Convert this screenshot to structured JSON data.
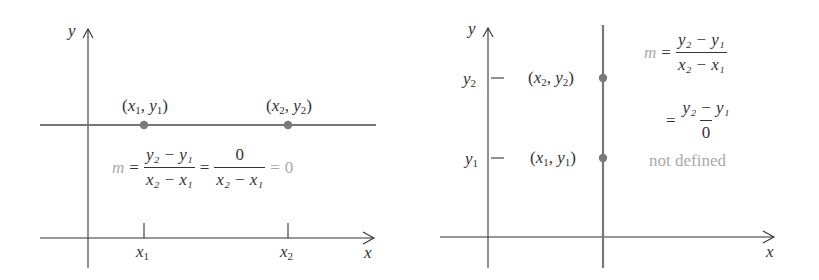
{
  "left_panel": {
    "axis_x_label": "x",
    "axis_y_label": "y",
    "point1": {
      "var_x": "x",
      "sub_x": "1",
      "var_y": "y",
      "sub_y": "1"
    },
    "point2": {
      "var_x": "x",
      "sub_x": "2",
      "var_y": "y",
      "sub_y": "2"
    },
    "tick_x1": {
      "var": "x",
      "sub": "1"
    },
    "tick_x2": {
      "var": "x",
      "sub": "2"
    },
    "line_type": "horizontal",
    "formula": {
      "m": "m",
      "eq": "=",
      "frac1_num": "y₂ − y₁",
      "frac1_den": "x₂ − x₁",
      "frac2_num": "0",
      "frac2_den": "x₂ − x₁",
      "result": "0"
    }
  },
  "right_panel": {
    "axis_x_label": "x",
    "axis_y_label": "y",
    "point1": {
      "var_x": "x",
      "sub_x": "1",
      "var_y": "y",
      "sub_y": "1"
    },
    "point2": {
      "var_x": "x",
      "sub_x": "2",
      "var_y": "y",
      "sub_y": "2"
    },
    "tick_y1": {
      "var": "y",
      "sub": "1"
    },
    "tick_y2": {
      "var": "y",
      "sub": "2"
    },
    "line_type": "vertical",
    "formula": {
      "m": "m",
      "eq": "=",
      "frac1_num": "y₂ − y₁",
      "frac1_den": "x₂ − x₁",
      "frac2_num": "y₂ − y₁",
      "frac2_den": "0",
      "result": "not defined"
    }
  },
  "colors": {
    "axis": "#333333",
    "line": "#777777",
    "point": "#7a7a7a",
    "muted_text": "#a9a9a9"
  }
}
